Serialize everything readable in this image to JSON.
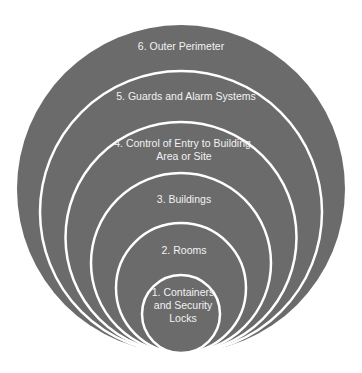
{
  "diagram": {
    "type": "nested-concentric-circles",
    "fill_color": "#6b6b6b",
    "stroke_color": "#ffffff",
    "text_color": "#f2f2f2",
    "layers": [
      {
        "level": 6,
        "label": "6. Outer Perimeter",
        "cx": 181,
        "cy": 189,
        "r": 164,
        "label_x": 181,
        "label_y": 46
      },
      {
        "level": 5,
        "label": "5. Guards and Alarm Systems",
        "cx": 181,
        "cy": 212,
        "r": 141,
        "label_x": 186,
        "label_y": 96
      },
      {
        "level": 4,
        "label": "4. Control of Entry to Building,\nArea or Site",
        "cx": 181,
        "cy": 237.5,
        "r": 115.5,
        "label_x": 184,
        "label_y": 143
      },
      {
        "level": 3,
        "label": "3. Buildings",
        "cx": 181,
        "cy": 263,
        "r": 90,
        "label_x": 184,
        "label_y": 199
      },
      {
        "level": 2,
        "label": "2. Rooms",
        "cx": 181,
        "cy": 288,
        "r": 65,
        "label_x": 184,
        "label_y": 250
      },
      {
        "level": 1,
        "label": "1. Containers\nand Security\nLocks",
        "cx": 181,
        "cy": 314,
        "r": 39,
        "label_x": 183,
        "label_y": 292
      }
    ]
  }
}
